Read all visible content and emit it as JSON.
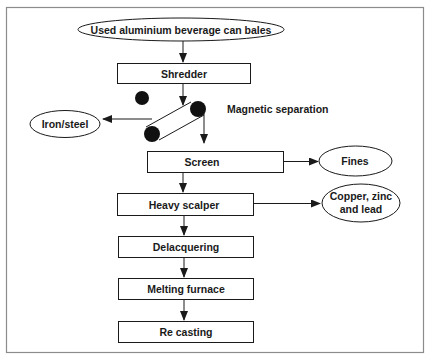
{
  "diagram": {
    "type": "process-flowchart",
    "colors": {
      "stroke": "#1a1a1a",
      "frame": "#8c8c8c",
      "fill": "#ffffff",
      "text": "#1a1a1a"
    },
    "input": {
      "label": "Used aluminium beverage can bales"
    },
    "steps": [
      {
        "id": "shredder",
        "label": "Shredder"
      },
      {
        "id": "screen",
        "label": "Screen"
      },
      {
        "id": "heavy-scalper",
        "label": "Heavy scalper"
      },
      {
        "id": "delacquering",
        "label": "Delacquering"
      },
      {
        "id": "melting-furnace",
        "label": "Melting furnace"
      },
      {
        "id": "re-casting",
        "label": "Re casting"
      }
    ],
    "magnetic_separation": {
      "label": "Magnetic separation"
    },
    "outputs": {
      "iron_steel": {
        "label": "Iron/steel"
      },
      "fines": {
        "label": "Fines"
      },
      "copper_zinc_lead": {
        "line1": "Copper, zinc",
        "line2": "and lead"
      }
    }
  }
}
